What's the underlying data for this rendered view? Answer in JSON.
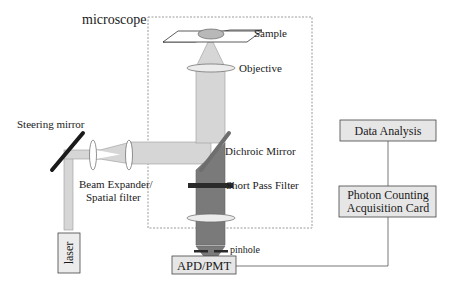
{
  "diagram": {
    "title": "microscope",
    "labels": {
      "sample": "Sample",
      "objective": "Objective",
      "steering_mirror": "Steering mirror",
      "beam_expander_line1": "Beam Expander/",
      "beam_expander_line2": "Spatial filter",
      "dichroic_mirror": "Dichroic Mirror",
      "short_pass_filter": "Short Pass Filter",
      "pinhole": "pinhole",
      "laser": "laser",
      "detector": "APD/PMT",
      "data_analysis": "Data Analysis",
      "acquisition_line1": "Photon Counting",
      "acquisition_line2": "Acquisition Card"
    },
    "colors": {
      "excitation_beam": "#d6d6d6",
      "emission_beam": "#7a7a7a",
      "box_fill": "#e6e6e6",
      "mirror": "#1a1a1a",
      "dashed_border": "#9a9a9a"
    },
    "connections": [
      {
        "from": "Data Analysis",
        "to": "Photon Counting Acquisition Card"
      },
      {
        "from": "Photon Counting Acquisition Card",
        "to": "APD/PMT"
      }
    ]
  }
}
